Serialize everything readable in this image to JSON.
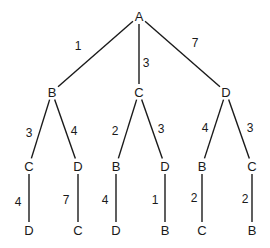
{
  "diagram": {
    "type": "tree",
    "nodes": [
      {
        "id": "n0",
        "label": "A",
        "x": 139,
        "y": 16
      },
      {
        "id": "n1",
        "label": "B",
        "x": 52,
        "y": 92
      },
      {
        "id": "n2",
        "label": "C",
        "x": 139,
        "y": 92
      },
      {
        "id": "n3",
        "label": "D",
        "x": 226,
        "y": 92
      },
      {
        "id": "n4",
        "label": "C",
        "x": 29,
        "y": 166
      },
      {
        "id": "n5",
        "label": "D",
        "x": 78,
        "y": 166
      },
      {
        "id": "n6",
        "label": "B",
        "x": 116,
        "y": 166
      },
      {
        "id": "n7",
        "label": "D",
        "x": 165,
        "y": 166
      },
      {
        "id": "n8",
        "label": "B",
        "x": 202,
        "y": 166
      },
      {
        "id": "n9",
        "label": "C",
        "x": 252,
        "y": 166
      },
      {
        "id": "n10",
        "label": "D",
        "x": 29,
        "y": 230
      },
      {
        "id": "n11",
        "label": "C",
        "x": 78,
        "y": 230
      },
      {
        "id": "n12",
        "label": "D",
        "x": 116,
        "y": 230
      },
      {
        "id": "n13",
        "label": "B",
        "x": 165,
        "y": 230
      },
      {
        "id": "n14",
        "label": "C",
        "x": 202,
        "y": 230
      },
      {
        "id": "n15",
        "label": "B",
        "x": 252,
        "y": 230
      }
    ],
    "edges": [
      {
        "from": "n0",
        "to": "n1",
        "weight": "1",
        "lx": 78,
        "ly": 46
      },
      {
        "from": "n0",
        "to": "n2",
        "weight": "3",
        "lx": 146,
        "ly": 63
      },
      {
        "from": "n0",
        "to": "n3",
        "weight": "7",
        "lx": 195,
        "ly": 43
      },
      {
        "from": "n1",
        "to": "n4",
        "weight": "3",
        "lx": 29,
        "ly": 133
      },
      {
        "from": "n1",
        "to": "n5",
        "weight": "4",
        "lx": 74,
        "ly": 131
      },
      {
        "from": "n2",
        "to": "n6",
        "weight": "2",
        "lx": 115,
        "ly": 131
      },
      {
        "from": "n2",
        "to": "n7",
        "weight": "3",
        "lx": 161,
        "ly": 129
      },
      {
        "from": "n3",
        "to": "n8",
        "weight": "4",
        "lx": 205,
        "ly": 128
      },
      {
        "from": "n3",
        "to": "n9",
        "weight": "3",
        "lx": 250,
        "ly": 128
      },
      {
        "from": "n4",
        "to": "n10",
        "weight": "4",
        "lx": 18,
        "ly": 202
      },
      {
        "from": "n5",
        "to": "n11",
        "weight": "7",
        "lx": 66,
        "ly": 200
      },
      {
        "from": "n6",
        "to": "n12",
        "weight": "4",
        "lx": 105,
        "ly": 200
      },
      {
        "from": "n7",
        "to": "n13",
        "weight": "1",
        "lx": 155,
        "ly": 200
      },
      {
        "from": "n8",
        "to": "n14",
        "weight": "2",
        "lx": 194,
        "ly": 198
      },
      {
        "from": "n9",
        "to": "n15",
        "weight": "2",
        "lx": 245,
        "ly": 199
      }
    ]
  }
}
